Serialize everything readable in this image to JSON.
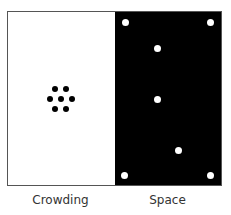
{
  "figure": {
    "panels": [
      {
        "id": "crowding",
        "label": "Crowding",
        "background": "#ffffff",
        "dot_color": "#000000"
      },
      {
        "id": "space",
        "label": "Space",
        "background": "#000000",
        "dot_color": "#ffffff"
      }
    ],
    "crowding_dots": [
      {
        "x": 55,
        "y": 89
      },
      {
        "x": 66,
        "y": 89
      },
      {
        "x": 50,
        "y": 99
      },
      {
        "x": 61,
        "y": 99
      },
      {
        "x": 72,
        "y": 99
      },
      {
        "x": 55,
        "y": 109
      },
      {
        "x": 66,
        "y": 109
      }
    ],
    "space_dots": [
      {
        "x": 125,
        "y": 22
      },
      {
        "x": 210,
        "y": 22
      },
      {
        "x": 157,
        "y": 48
      },
      {
        "x": 157,
        "y": 99
      },
      {
        "x": 178,
        "y": 150
      },
      {
        "x": 124,
        "y": 175
      },
      {
        "x": 210,
        "y": 175
      }
    ]
  }
}
